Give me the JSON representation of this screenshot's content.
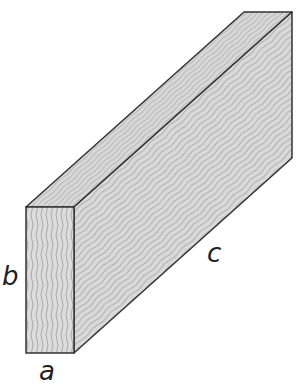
{
  "figure": {
    "labels": {
      "a": "a",
      "b": "b",
      "c": "c"
    },
    "colors": {
      "fill": "#d6d6d6",
      "grain": "#9a9a9a",
      "edge": "#333333"
    },
    "vertices": {
      "front_tl": [
        26,
        207
      ],
      "front_tr": [
        74,
        207
      ],
      "front_bl": [
        26,
        353
      ],
      "front_br": [
        74,
        353
      ],
      "back_tl": [
        244,
        12
      ],
      "back_tr": [
        292,
        12
      ],
      "back_br": [
        292,
        158
      ]
    }
  }
}
